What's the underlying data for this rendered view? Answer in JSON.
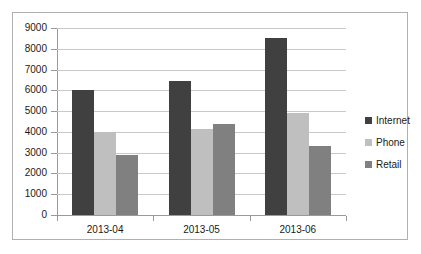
{
  "chart_data": {
    "type": "bar",
    "title": "",
    "subtitle": "",
    "xlabel": "",
    "ylabel": "",
    "categories": [
      "2013-04",
      "2013-05",
      "2013-06"
    ],
    "series": [
      {
        "name": "Internet",
        "color": "#404040",
        "values": [
          6000,
          6450,
          8500
        ]
      },
      {
        "name": "Phone",
        "color": "#bfbfbf",
        "values": [
          4000,
          4150,
          4900
        ]
      },
      {
        "name": "Retail",
        "color": "#808080",
        "values": [
          2900,
          4400,
          3300
        ]
      }
    ],
    "ylim": [
      0,
      9000
    ],
    "ytick_step": 1000,
    "ytick_labels": [
      "9000",
      "8000",
      "7000",
      "6000",
      "5000",
      "4000",
      "3000",
      "2000",
      "1000",
      "0"
    ],
    "grid": true,
    "grid_axis": "y",
    "legend": true,
    "legend_position": "right",
    "border": true,
    "background_color": "#ffffff",
    "grid_color": "#c9c9c9",
    "axis_color": "#9a9a9a",
    "border_color": "#b0b0b0"
  }
}
